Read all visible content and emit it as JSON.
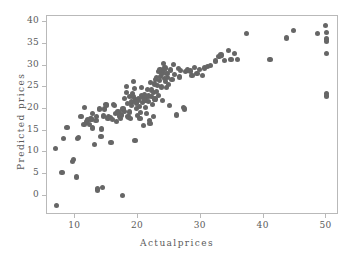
{
  "chart_data": {
    "type": "scatter",
    "title": "",
    "xlabel": "Actualprices",
    "ylabel": "Predicted prices",
    "xlim": [
      5.5,
      52.0
    ],
    "ylim": [
      -4.5,
      41.5
    ],
    "xticks": [
      10,
      20,
      30,
      40,
      50
    ],
    "yticks": [
      0,
      5,
      10,
      15,
      20,
      25,
      30,
      35,
      40
    ],
    "grid": false,
    "legend": null,
    "marker": {
      "shape": "circle",
      "color": "#666666",
      "size": 5
    },
    "n_points": 160,
    "series": [
      {
        "name": "predicted vs actual",
        "points": [
          [
            6.9,
            10.9
          ],
          [
            7.0,
            -2.3
          ],
          [
            7.9,
            5.4
          ],
          [
            8.1,
            13.2
          ],
          [
            8.7,
            15.7
          ],
          [
            9.6,
            7.9
          ],
          [
            9.7,
            8.4
          ],
          [
            10.2,
            4.3
          ],
          [
            10.4,
            13.1
          ],
          [
            10.5,
            13.5
          ],
          [
            10.9,
            18.2
          ],
          [
            11.4,
            16.4
          ],
          [
            11.5,
            20.4
          ],
          [
            11.8,
            17.0
          ],
          [
            12.0,
            17.6
          ],
          [
            12.3,
            16.5
          ],
          [
            12.5,
            17.7
          ],
          [
            12.7,
            15.6
          ],
          [
            12.7,
            19.0
          ],
          [
            13.1,
            11.8
          ],
          [
            13.3,
            17.4
          ],
          [
            13.4,
            18.3
          ],
          [
            13.5,
            1.3
          ],
          [
            13.6,
            1.6
          ],
          [
            13.8,
            19.8
          ],
          [
            13.9,
            20.2
          ],
          [
            14.1,
            13.6
          ],
          [
            14.2,
            15.4
          ],
          [
            14.4,
            1.8
          ],
          [
            14.5,
            18.4
          ],
          [
            14.6,
            20.0
          ],
          [
            14.9,
            21.1
          ],
          [
            15.0,
            20.8
          ],
          [
            15.2,
            17.8
          ],
          [
            15.3,
            18.2
          ],
          [
            15.6,
            18.0
          ],
          [
            15.7,
            12.3
          ],
          [
            15.9,
            17.5
          ],
          [
            16.1,
            21.0
          ],
          [
            16.2,
            20.9
          ],
          [
            16.4,
            18.9
          ],
          [
            16.6,
            17.2
          ],
          [
            16.8,
            19.3
          ],
          [
            17.1,
            18.4
          ],
          [
            17.2,
            17.9
          ],
          [
            17.4,
            18.6
          ],
          [
            17.5,
            0.1
          ],
          [
            17.6,
            20.0
          ],
          [
            17.8,
            19.4
          ],
          [
            17.9,
            22.5
          ],
          [
            18.1,
            25.2
          ],
          [
            18.2,
            23.9
          ],
          [
            18.3,
            21.2
          ],
          [
            18.4,
            18.2
          ],
          [
            18.5,
            18.0
          ],
          [
            18.6,
            22.8
          ],
          [
            18.7,
            19.3
          ],
          [
            18.8,
            17.8
          ],
          [
            18.9,
            21.6
          ],
          [
            19.0,
            20.8
          ],
          [
            19.1,
            23.6
          ],
          [
            19.2,
            22.9
          ],
          [
            19.3,
            26.3
          ],
          [
            19.4,
            24.8
          ],
          [
            19.5,
            21.8
          ],
          [
            19.5,
            12.8
          ],
          [
            19.6,
            22.2
          ],
          [
            19.7,
            21.4
          ],
          [
            19.8,
            20.1
          ],
          [
            19.9,
            18.5
          ],
          [
            20.0,
            21.9
          ],
          [
            20.1,
            22.4
          ],
          [
            20.2,
            20.6
          ],
          [
            20.3,
            17.9
          ],
          [
            20.4,
            19.1
          ],
          [
            20.5,
            23.1
          ],
          [
            20.6,
            25.0
          ],
          [
            20.7,
            21.5
          ],
          [
            20.8,
            22.6
          ],
          [
            20.9,
            16.2
          ],
          [
            21.0,
            23.4
          ],
          [
            21.1,
            22.1
          ],
          [
            21.2,
            20.4
          ],
          [
            21.3,
            18.9
          ],
          [
            21.4,
            22.8
          ],
          [
            21.5,
            24.6
          ],
          [
            21.6,
            23.0
          ],
          [
            21.7,
            21.7
          ],
          [
            21.8,
            17.4
          ],
          [
            21.9,
            16.6
          ],
          [
            22.0,
            26.2
          ],
          [
            22.1,
            24.4
          ],
          [
            22.2,
            22.9
          ],
          [
            22.3,
            21.1
          ],
          [
            22.4,
            18.3
          ],
          [
            22.5,
            23.8
          ],
          [
            22.6,
            25.8
          ],
          [
            22.7,
            22.3
          ],
          [
            22.8,
            26.9
          ],
          [
            22.9,
            24.1
          ],
          [
            23.0,
            27.2
          ],
          [
            23.1,
            25.4
          ],
          [
            23.2,
            23.2
          ],
          [
            23.3,
            28.7
          ],
          [
            23.4,
            26.5
          ],
          [
            23.5,
            29.2
          ],
          [
            23.6,
            27.6
          ],
          [
            23.7,
            25.1
          ],
          [
            23.8,
            28.2
          ],
          [
            23.9,
            22.0
          ],
          [
            24.0,
            30.6
          ],
          [
            24.1,
            28.9
          ],
          [
            24.2,
            27.0
          ],
          [
            24.3,
            29.5
          ],
          [
            24.4,
            26.4
          ],
          [
            24.5,
            24.9
          ],
          [
            24.6,
            28.3
          ],
          [
            24.7,
            27.3
          ],
          [
            24.8,
            25.6
          ],
          [
            25.0,
            20.9
          ],
          [
            25.2,
            29.0
          ],
          [
            25.4,
            26.8
          ],
          [
            25.6,
            30.3
          ],
          [
            25.8,
            28.0
          ],
          [
            26.1,
            18.6
          ],
          [
            26.4,
            29.4
          ],
          [
            26.6,
            27.4
          ],
          [
            26.8,
            28.9
          ],
          [
            27.2,
            20.3
          ],
          [
            27.4,
            20.0
          ],
          [
            27.6,
            28.7
          ],
          [
            27.9,
            29.0
          ],
          [
            28.3,
            28.8
          ],
          [
            28.6,
            27.7
          ],
          [
            29.0,
            29.6
          ],
          [
            29.4,
            28.2
          ],
          [
            29.8,
            29.1
          ],
          [
            30.2,
            27.8
          ],
          [
            30.6,
            29.5
          ],
          [
            31.0,
            29.9
          ],
          [
            31.6,
            30.1
          ],
          [
            32.3,
            31.1
          ],
          [
            32.9,
            32.2
          ],
          [
            33.2,
            32.5
          ],
          [
            33.8,
            31.2
          ],
          [
            34.4,
            33.5
          ],
          [
            34.8,
            31.5
          ],
          [
            35.3,
            32.9
          ],
          [
            35.9,
            31.4
          ],
          [
            37.3,
            37.4
          ],
          [
            41.0,
            31.4
          ],
          [
            43.6,
            36.4
          ],
          [
            44.7,
            38.1
          ],
          [
            48.6,
            37.5
          ],
          [
            49.8,
            39.3
          ],
          [
            50.0,
            37.7
          ],
          [
            50.0,
            36.2
          ],
          [
            50.0,
            35.6
          ],
          [
            50.0,
            32.9
          ],
          [
            50.0,
            23.5
          ],
          [
            50.0,
            23.0
          ]
        ]
      }
    ]
  },
  "axes": {
    "x_tick_labels": [
      "10",
      "20",
      "30",
      "40",
      "50"
    ],
    "y_tick_labels": [
      "0",
      "5",
      "10",
      "15",
      "20",
      "25",
      "30",
      "35",
      "40"
    ],
    "x_title": "Actualprices",
    "y_title": "Predicted prices"
  },
  "colors": {
    "marker": "#666666",
    "axis": "#b9b9b9",
    "text": "#5a5a5a",
    "background": "#ffffff"
  }
}
